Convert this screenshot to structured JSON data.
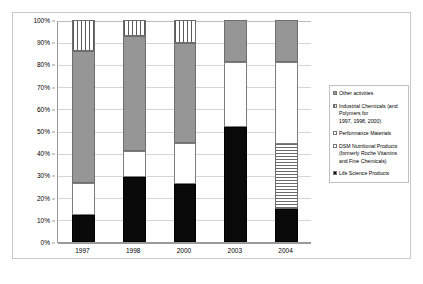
{
  "chart_data": {
    "type": "bar",
    "subtype": "100% stacked column",
    "title": "",
    "xlabel": "",
    "ylabel": "",
    "categories": [
      "1997",
      "1998",
      "2000",
      "2003",
      "2004"
    ],
    "ylim": [
      0,
      100
    ],
    "ytick_labels": [
      "0%",
      "10%",
      "20%",
      "30%",
      "40%",
      "50%",
      "60%",
      "70%",
      "80%",
      "90%",
      "100%"
    ],
    "ytick_values": [
      0,
      10,
      20,
      30,
      40,
      50,
      60,
      70,
      80,
      90,
      100
    ],
    "grid": true,
    "legend_position": "right",
    "series": [
      {
        "name": "Life Science Products",
        "fill": "solid-black",
        "color": "#0a0a0a",
        "values": [
          12,
          29.5,
          26,
          52,
          15
        ]
      },
      {
        "name": "DSM Nutritional Products (formerly Roche Vitamins and Fine Chemicals)",
        "fill": "horizontal-stripe",
        "color": "#ffffff",
        "values": [
          0,
          0,
          0,
          0,
          29
        ]
      },
      {
        "name": "Performance Materials",
        "fill": "open-white",
        "color": "#ffffff",
        "values": [
          14.5,
          11.5,
          18.5,
          29,
          37
        ]
      },
      {
        "name": "Other activities",
        "fill": "solid-gray",
        "color": "#969696",
        "values": [
          59.5,
          52,
          45,
          19,
          19
        ]
      },
      {
        "name": "Industrial Chemicals (and Polymers for 1997, 1998, 2000)",
        "fill": "vertical-stripe",
        "color": "#ffffff",
        "values": [
          14,
          7,
          10.5,
          0,
          0
        ]
      }
    ],
    "stacks": [
      {
        "category": "1997",
        "segments": [
          {
            "series": "Life Science Products",
            "fill": "solid-black",
            "from": 0,
            "to": 12
          },
          {
            "series": "Performance Materials",
            "fill": "open-white",
            "from": 12,
            "to": 26.5
          },
          {
            "series": "Other activities",
            "fill": "solid-gray",
            "from": 26.5,
            "to": 86
          },
          {
            "series": "Industrial Chemicals (and Polymers for 1997, 1998, 2000)",
            "fill": "vertical-stripe",
            "from": 86,
            "to": 100
          }
        ]
      },
      {
        "category": "1998",
        "segments": [
          {
            "series": "Life Science Products",
            "fill": "solid-black",
            "from": 0,
            "to": 29.5
          },
          {
            "series": "Performance Materials",
            "fill": "open-white",
            "from": 29.5,
            "to": 41
          },
          {
            "series": "Other activities",
            "fill": "solid-gray",
            "from": 41,
            "to": 93
          },
          {
            "series": "Industrial Chemicals (and Polymers for 1997, 1998, 2000)",
            "fill": "vertical-stripe",
            "from": 93,
            "to": 100
          }
        ]
      },
      {
        "category": "2000",
        "segments": [
          {
            "series": "Life Science Products",
            "fill": "solid-black",
            "from": 0,
            "to": 26
          },
          {
            "series": "Performance Materials",
            "fill": "open-white",
            "from": 26,
            "to": 44.5
          },
          {
            "series": "Other activities",
            "fill": "solid-gray",
            "from": 44.5,
            "to": 89.5
          },
          {
            "series": "Industrial Chemicals (and Polymers for 1997, 1998, 2000)",
            "fill": "vertical-stripe",
            "from": 89.5,
            "to": 100
          }
        ]
      },
      {
        "category": "2003",
        "segments": [
          {
            "series": "Life Science Products",
            "fill": "solid-black",
            "from": 0,
            "to": 52
          },
          {
            "series": "Performance Materials",
            "fill": "open-white",
            "from": 52,
            "to": 81
          },
          {
            "series": "Other activities",
            "fill": "solid-gray",
            "from": 81,
            "to": 100
          }
        ]
      },
      {
        "category": "2004",
        "segments": [
          {
            "series": "Life Science Products",
            "fill": "solid-black",
            "from": 0,
            "to": 15
          },
          {
            "series": "DSM Nutritional Products (formerly Roche Vitamins and Fine Chemicals)",
            "fill": "horizontal-stripe",
            "from": 15,
            "to": 44
          },
          {
            "series": "Performance Materials",
            "fill": "open-white",
            "from": 44,
            "to": 81
          },
          {
            "series": "Other activities",
            "fill": "solid-gray",
            "from": 81,
            "to": 100
          }
        ]
      }
    ],
    "legend_entries": [
      {
        "label": "Other activities",
        "fill": "solid-gray"
      },
      {
        "label": "Industrial Chemicals (and\n   Polymers for\n   1997, 1998, 2000)",
        "fill": "vertical-stripe"
      },
      {
        "label": "Performance Materials",
        "fill": "open-white"
      },
      {
        "label": "DSM Nutritional Products\n   (formerly Roche Vitamins\n   and Fine Chemicals)",
        "fill": "open-white"
      },
      {
        "label": "Life Science Products",
        "fill": "solid-black"
      }
    ]
  }
}
